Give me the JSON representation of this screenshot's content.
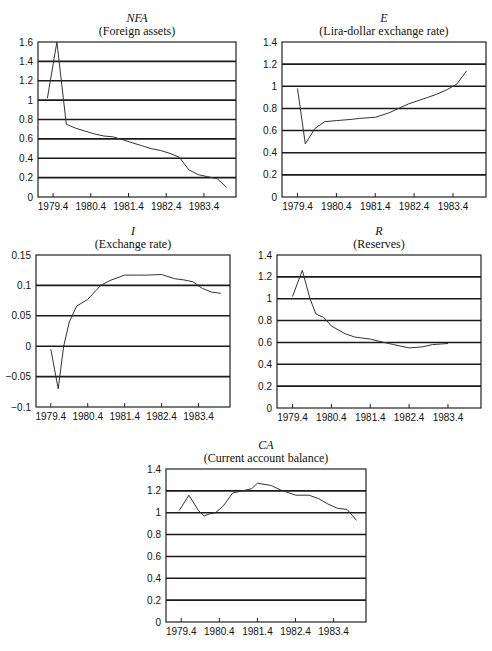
{
  "chart_data": [
    {
      "id": "nfa",
      "type": "line",
      "title": "NFA",
      "subtitle": "(Foreign assets)",
      "xlabel": "",
      "ylabel": "",
      "ylim": [
        0,
        1.6
      ],
      "yticks": [
        0,
        0.2,
        0.4,
        0.6,
        0.8,
        1,
        1.2,
        1.4,
        1.6
      ],
      "ytick_labels": [
        "0",
        "0.2",
        "0.4",
        "0.6",
        "0.8",
        "1",
        "1.2",
        "1.4",
        "1.6"
      ],
      "xlim": [
        1979.0,
        1984.25
      ],
      "xticks": [
        1979.4,
        1980.4,
        1981.4,
        1982.4,
        1983.4
      ],
      "xtick_labels": [
        "1979.4",
        "1980.4",
        "1981.4",
        "1982.4",
        "1983.4"
      ],
      "grid": true,
      "series": [
        {
          "name": "NFA",
          "x": [
            1979.25,
            1979.5,
            1979.75,
            1980.0,
            1980.25,
            1980.5,
            1980.75,
            1981.0,
            1981.25,
            1981.5,
            1981.75,
            1982.0,
            1982.25,
            1982.5,
            1982.75,
            1983.0,
            1983.25,
            1983.5,
            1983.75,
            1984.0
          ],
          "values": [
            1.02,
            1.6,
            0.75,
            0.71,
            0.68,
            0.65,
            0.63,
            0.62,
            0.59,
            0.56,
            0.53,
            0.5,
            0.48,
            0.45,
            0.41,
            0.28,
            0.23,
            0.21,
            0.19,
            0.1
          ]
        }
      ]
    },
    {
      "id": "e",
      "type": "line",
      "title": "E",
      "subtitle": "(Lira-dollar exchange rate)",
      "xlabel": "",
      "ylabel": "",
      "ylim": [
        0,
        1.4
      ],
      "yticks": [
        0,
        0.2,
        0.4,
        0.6,
        0.8,
        1,
        1.2,
        1.4
      ],
      "ytick_labels": [
        "0",
        "0.2",
        "0.4",
        "0.6",
        "0.8",
        "1",
        "1.2",
        "1.4"
      ],
      "xlim": [
        1979.0,
        1984.25
      ],
      "xticks": [
        1979.4,
        1980.4,
        1981.4,
        1982.4,
        1983.4
      ],
      "xtick_labels": [
        "1979.4",
        "1980.4",
        "1981.4",
        "1982.4",
        "1983.4"
      ],
      "grid": true,
      "series": [
        {
          "name": "E",
          "x": [
            1979.4,
            1979.6,
            1979.85,
            1980.1,
            1980.4,
            1980.75,
            1981.0,
            1981.4,
            1981.75,
            1982.0,
            1982.25,
            1982.5,
            1982.75,
            1983.0,
            1983.25,
            1983.5,
            1983.75
          ],
          "values": [
            0.98,
            0.48,
            0.62,
            0.68,
            0.69,
            0.7,
            0.71,
            0.72,
            0.76,
            0.8,
            0.84,
            0.87,
            0.9,
            0.93,
            0.97,
            1.02,
            1.14
          ]
        }
      ]
    },
    {
      "id": "i",
      "type": "line",
      "title": "I",
      "subtitle": "(Exchange rate)",
      "xlabel": "",
      "ylabel": "",
      "ylim": [
        -0.1,
        0.15
      ],
      "yticks": [
        -0.1,
        -0.05,
        0,
        0.05,
        0.1,
        0.15
      ],
      "ytick_labels": [
        "−0.1",
        "−0.05",
        "0",
        "0.05",
        "0.1",
        "0.15"
      ],
      "xlim": [
        1979.0,
        1984.25
      ],
      "xticks": [
        1979.4,
        1980.4,
        1981.4,
        1982.4,
        1983.4
      ],
      "xtick_labels": [
        "1979.4",
        "1980.4",
        "1981.4",
        "1982.4",
        "1983.4"
      ],
      "grid": true,
      "series": [
        {
          "name": "I",
          "x": [
            1979.4,
            1979.6,
            1979.75,
            1979.9,
            1980.1,
            1980.4,
            1980.75,
            1981.0,
            1981.4,
            1981.75,
            1982.0,
            1982.4,
            1982.75,
            1983.0,
            1983.25,
            1983.5,
            1983.75,
            1984.0
          ],
          "values": [
            -0.005,
            -0.07,
            0.0,
            0.04,
            0.066,
            0.077,
            0.1,
            0.108,
            0.117,
            0.117,
            0.117,
            0.118,
            0.111,
            0.109,
            0.106,
            0.095,
            0.089,
            0.087
          ]
        }
      ]
    },
    {
      "id": "r",
      "type": "line",
      "title": "R",
      "subtitle": "(Reserves)",
      "xlabel": "",
      "ylabel": "",
      "ylim": [
        0,
        1.4
      ],
      "yticks": [
        0,
        0.2,
        0.4,
        0.6,
        0.8,
        1,
        1.2,
        1.4
      ],
      "ytick_labels": [
        "0",
        "0.2",
        "0.4",
        "0.6",
        "0.8",
        "1",
        "1.2",
        "1.4"
      ],
      "xlim": [
        1979.0,
        1984.25
      ],
      "xticks": [
        1979.4,
        1980.4,
        1981.4,
        1982.4,
        1983.4
      ],
      "xtick_labels": [
        "1979.4",
        "1980.4",
        "1981.4",
        "1982.4",
        "1983.4"
      ],
      "grid": true,
      "series": [
        {
          "name": "R",
          "x": [
            1979.4,
            1979.65,
            1979.85,
            1980.0,
            1980.2,
            1980.4,
            1980.75,
            1981.0,
            1981.4,
            1981.75,
            1982.0,
            1982.4,
            1982.75,
            1983.0,
            1983.4
          ],
          "values": [
            1.02,
            1.26,
            1.0,
            0.86,
            0.83,
            0.75,
            0.68,
            0.65,
            0.63,
            0.6,
            0.58,
            0.55,
            0.56,
            0.58,
            0.59
          ]
        }
      ]
    },
    {
      "id": "ca",
      "type": "line",
      "title": "CA",
      "subtitle": "(Current account balance)",
      "xlabel": "",
      "ylabel": "",
      "ylim": [
        0,
        1.4
      ],
      "yticks": [
        0,
        0.2,
        0.4,
        0.6,
        0.8,
        1,
        1.2,
        1.4
      ],
      "ytick_labels": [
        "0",
        "0.2",
        "0.4",
        "0.6",
        "0.8",
        "1",
        "1.2",
        "1.4"
      ],
      "xlim": [
        1979.0,
        1984.25
      ],
      "xticks": [
        1979.4,
        1980.4,
        1981.4,
        1982.4,
        1983.4
      ],
      "xtick_labels": [
        "1979.4",
        "1980.4",
        "1981.4",
        "1982.4",
        "1983.4"
      ],
      "grid": true,
      "series": [
        {
          "name": "CA",
          "x": [
            1979.35,
            1979.6,
            1979.85,
            1980.0,
            1980.15,
            1980.3,
            1980.5,
            1980.75,
            1981.0,
            1981.25,
            1981.4,
            1981.75,
            1982.0,
            1982.4,
            1982.75,
            1983.0,
            1983.25,
            1983.5,
            1983.75,
            1984.0
          ],
          "values": [
            1.02,
            1.16,
            1.02,
            0.97,
            0.99,
            1.0,
            1.06,
            1.18,
            1.2,
            1.22,
            1.27,
            1.25,
            1.21,
            1.16,
            1.16,
            1.13,
            1.08,
            1.04,
            1.03,
            0.93
          ]
        }
      ]
    }
  ]
}
